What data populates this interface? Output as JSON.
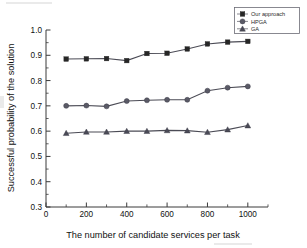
{
  "chart_data": {
    "type": "line",
    "title": "",
    "xlabel": "The number of candidate services per task",
    "ylabel": "Successful probability of the solution",
    "x": [
      100,
      200,
      300,
      400,
      500,
      600,
      700,
      800,
      900,
      1000
    ],
    "xlim": [
      0,
      1100
    ],
    "ylim": [
      0.3,
      1.0
    ],
    "xticks": [
      0,
      200,
      400,
      600,
      800,
      1000
    ],
    "xticklabels": [
      "0",
      "200",
      "400",
      "600",
      "800",
      "1000"
    ],
    "yticks": [
      0.3,
      0.4,
      0.5,
      0.6,
      0.7,
      0.8,
      0.9,
      1.0
    ],
    "yticklabels": [
      "0.3",
      "0.4",
      "0.5",
      "0.6",
      "0.7",
      "0.8",
      "0.9",
      "1.0"
    ],
    "grid": false,
    "legend_position": "top-right",
    "series": [
      {
        "name": "Our approach",
        "marker": "square",
        "values": [
          0.885,
          0.886,
          0.887,
          0.879,
          0.907,
          0.908,
          0.925,
          0.945,
          0.952,
          0.955
        ]
      },
      {
        "name": "HPGA",
        "marker": "circle",
        "values": [
          0.7,
          0.701,
          0.698,
          0.719,
          0.722,
          0.724,
          0.724,
          0.76,
          0.772,
          0.777
        ]
      },
      {
        "name": "GA",
        "marker": "triangle",
        "values": [
          0.592,
          0.597,
          0.597,
          0.6,
          0.6,
          0.603,
          0.602,
          0.596,
          0.606,
          0.622
        ]
      }
    ]
  },
  "legend": {
    "items": [
      {
        "label": "Our approach"
      },
      {
        "label": "HPGA"
      },
      {
        "label": "GA"
      }
    ]
  },
  "axes": {
    "x_title": "The number of candidate services per task",
    "y_title": "Successful probability of the solution"
  }
}
